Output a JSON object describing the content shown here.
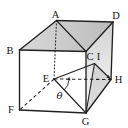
{
  "figure": {
    "type": "cube-geometry-diagram",
    "canvas": {
      "width": 128,
      "height": 128,
      "background": "#ffffff"
    },
    "colors": {
      "line": "#212121",
      "label": "#161616",
      "top_face_left": "#d8d8d8",
      "top_face_right": "#bcbcbc",
      "right_face_top": "#d0d0d0",
      "right_face_bottom": "#fdfdfd",
      "shaded_triangle": "#bfbfbf"
    },
    "vertices": {
      "A": {
        "label": "A",
        "x": 56.5,
        "y": 20.5,
        "lx": 55.5,
        "ly": 17.5
      },
      "B": {
        "label": "B",
        "x": 19.5,
        "y": 50,
        "lx": 10,
        "ly": 53.5
      },
      "C": {
        "label": "C",
        "x": 86,
        "y": 51.5,
        "lx": 90,
        "ly": 60
      },
      "D": {
        "label": "D",
        "x": 113,
        "y": 22,
        "lx": 116,
        "ly": 18.5
      },
      "E": {
        "label": "E",
        "x": 54,
        "y": 79,
        "lx": 46,
        "ly": 82
      },
      "F": {
        "label": "F",
        "x": 19.5,
        "y": 110,
        "lx": 11,
        "ly": 112.5
      },
      "G": {
        "label": "G",
        "x": 86,
        "y": 113,
        "lx": 85.5,
        "ly": 124.5
      },
      "H": {
        "label": "H",
        "x": 111,
        "y": 79.5,
        "lx": 118.5,
        "ly": 83
      },
      "I": {
        "label": "I",
        "x": 94.5,
        "y": 63.5,
        "lx": 98.5,
        "ly": 59.5
      }
    },
    "faces": [
      {
        "name": "top-ABCD",
        "points": [
          "A",
          "D",
          "C",
          "B"
        ],
        "fill": "top",
        "opacity": 1
      },
      {
        "name": "right-CDHG",
        "points": [
          "C",
          "D",
          "H",
          "G"
        ],
        "fill": "right",
        "opacity": 1
      },
      {
        "name": "triangle-IGH",
        "points": [
          "I",
          "G",
          "H"
        ],
        "fill": "flat",
        "opacity": 0.5
      }
    ],
    "edges": {
      "dotted": [
        [
          "A",
          "E"
        ]
      ],
      "dashed": [
        [
          "E",
          "F"
        ],
        [
          "E",
          "H"
        ]
      ],
      "construction": [
        [
          "E",
          "G"
        ],
        [
          "E",
          "I"
        ],
        [
          "I",
          "G"
        ],
        [
          "I",
          "H"
        ]
      ],
      "diagonal": [
        [
          "A",
          "C"
        ]
      ],
      "solid": [
        [
          "B",
          "A"
        ],
        [
          "A",
          "D"
        ],
        [
          "B",
          "C"
        ],
        [
          "C",
          "D"
        ],
        [
          "B",
          "F"
        ],
        [
          "C",
          "G"
        ],
        [
          "D",
          "H"
        ],
        [
          "F",
          "G"
        ],
        [
          "G",
          "H"
        ]
      ]
    },
    "angle": {
      "symbol": "θ",
      "vertex": "E",
      "label_x": 59.5,
      "label_y": 99,
      "arc_radius": 15,
      "arc_start_deg": 47,
      "arc_end_deg": 4
    },
    "arrow": {
      "from": "I",
      "to": "H"
    }
  }
}
